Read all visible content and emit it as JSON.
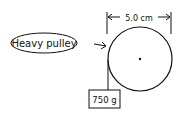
{
  "diagram": {
    "label_callout": "Heavy pulley",
    "dimension_label": "5.0 cm",
    "mass_label": "750 g",
    "colors": {
      "ink": "#111111",
      "background": "#ffffff"
    }
  }
}
